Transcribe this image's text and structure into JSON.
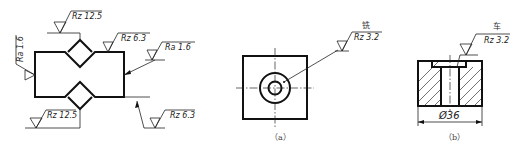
{
  "figure_left": {
    "annotations": {
      "top_notch": "Rz 12.5",
      "top_right": "Rz 6.3",
      "left_side": "Ra 1.6",
      "right_side": "Ra 1.6",
      "bottom_notch": "Rz 12.5",
      "bottom_right": "Rz 6.3"
    }
  },
  "figure_a": {
    "process": "铣",
    "roughness": "Rz 3.2",
    "caption": "（a）"
  },
  "figure_b": {
    "process": "车",
    "roughness": "Rz 3.2",
    "dimension": "Ø36",
    "caption": "（b）"
  },
  "colors": {
    "line": "#111111",
    "background": "#ffffff"
  }
}
